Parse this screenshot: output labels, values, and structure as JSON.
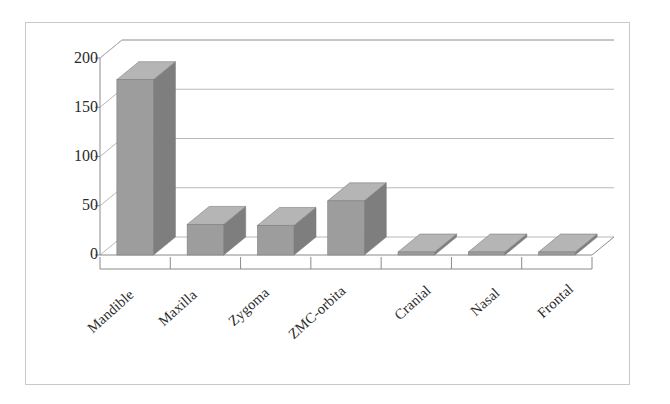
{
  "chart_data": {
    "type": "bar",
    "title": "",
    "subtitle": "",
    "xlabel": "",
    "ylabel": "",
    "categories": [
      "Mandible",
      "Maxilla",
      "Zygoma",
      "ZMC-orbita",
      "Cranial",
      "Nasal",
      "Frontal"
    ],
    "values": [
      178,
      31,
      30,
      55,
      3,
      3,
      3
    ],
    "series": [
      {
        "name": "Fractures",
        "values": [
          178,
          31,
          30,
          55,
          3,
          3,
          3
        ]
      }
    ],
    "ylim": [
      0,
      200
    ],
    "ytick_labels": [
      "0",
      "50",
      "100",
      "150",
      "200"
    ],
    "ytick_values": [
      0,
      50,
      100,
      150,
      200
    ],
    "grid": true,
    "grid_axis": "y",
    "legend": false,
    "legend_position": "none",
    "style": "3d-column",
    "colors": {
      "bar_front": "#9d9d9d",
      "bar_top": "#b5b5b5",
      "bar_side": "#7e7e7e",
      "gridline": "#b0b0b0",
      "axis": "#8a8a8a",
      "frame": "#c9c9c9",
      "plot_background": "#ffffff",
      "text": "#2b2b2b"
    }
  },
  "axes": {
    "y": {
      "ticks": [
        {
          "label": "200",
          "value": 200
        },
        {
          "label": "150",
          "value": 150
        },
        {
          "label": "100",
          "value": 100
        },
        {
          "label": "50",
          "value": 50
        },
        {
          "label": "0",
          "value": 0
        }
      ]
    },
    "x": {
      "ticks": [
        {
          "label": "Mandible"
        },
        {
          "label": "Maxilla"
        },
        {
          "label": "Zygoma"
        },
        {
          "label": "ZMC-orbita"
        },
        {
          "label": "Cranial"
        },
        {
          "label": "Nasal"
        },
        {
          "label": "Frontal"
        }
      ]
    }
  }
}
